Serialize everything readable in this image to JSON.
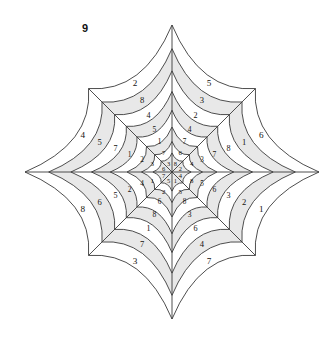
{
  "puzzle": {
    "label": "9",
    "title_visible": "9",
    "type": "spider-web-number-puzzle",
    "background_color": "#ffffff",
    "line_color": "#3a3a3a",
    "band_fill_color": "#e8e8e8",
    "band_alt_color": "#ffffff",
    "number_color": "#15130f",
    "ring_count": 8,
    "sector_count": 8,
    "center": {
      "x": 172,
      "y": 172
    },
    "outer_radius_axis": 147,
    "outer_radius_diagonal": 118
  },
  "chart_data": {
    "type": "table",
    "title": "9",
    "xlabel": "",
    "ylabel": "",
    "categories": [
      "up-left",
      "up-right",
      "right-up",
      "right-down",
      "down-right",
      "down-left",
      "left-down",
      "left-up"
    ],
    "rings": [
      1,
      2,
      3,
      4,
      5,
      6,
      7,
      8
    ],
    "series": [
      {
        "name": "up-left",
        "values": [
          8,
          6,
          7,
          4,
          2,
          3,
          5,
          0
        ]
      },
      {
        "name": "up-right",
        "values": [
          2,
          4,
          3,
          7,
          8,
          1,
          6,
          0
        ]
      },
      {
        "name": "right-up",
        "values": [
          4,
          8,
          5,
          6,
          3,
          2,
          1,
          0
        ]
      },
      {
        "name": "right-down",
        "values": [
          1,
          5,
          8,
          3,
          6,
          4,
          7,
          0
        ]
      },
      {
        "name": "down-right",
        "values": [
          5,
          2,
          6,
          8,
          1,
          7,
          3,
          0
        ]
      },
      {
        "name": "down-left",
        "values": [
          7,
          1,
          4,
          2,
          5,
          6,
          8,
          0
        ]
      },
      {
        "name": "left-down",
        "values": [
          6,
          3,
          2,
          1,
          7,
          5,
          4,
          0
        ]
      },
      {
        "name": "left-up",
        "values": [
          3,
          7,
          1,
          5,
          4,
          8,
          2,
          0
        ]
      }
    ],
    "legend_position": "none",
    "grid": true
  },
  "sectors": [
    {
      "name": "up-left",
      "label": "upper-left-of-vertical",
      "numbers_inner_to_outer": [
        "8",
        "6",
        "7",
        "4",
        "2",
        "3",
        "5"
      ]
    },
    {
      "name": "up-right",
      "label": "upper-right-of-vertical",
      "numbers_inner_to_outer": [
        "2",
        "4",
        "3",
        "7",
        "8",
        "1",
        "6"
      ]
    },
    {
      "name": "right-up",
      "label": "right-arm-upper",
      "numbers_inner_to_outer": [
        "4",
        "8",
        "5",
        "6",
        "3",
        "2",
        "1"
      ]
    },
    {
      "name": "right-down",
      "label": "right-arm-lower",
      "numbers_inner_to_outer": [
        "1",
        "5",
        "8",
        "3",
        "6",
        "4",
        "7"
      ]
    },
    {
      "name": "down-right",
      "label": "lower-right-of-vertical",
      "numbers_inner_to_outer": [
        "5",
        "2",
        "6",
        "8",
        "1",
        "7",
        "3"
      ]
    },
    {
      "name": "down-left",
      "label": "lower-left-of-vertical",
      "numbers_inner_to_outer": [
        "7",
        "1",
        "4",
        "2",
        "5",
        "6",
        "8"
      ]
    },
    {
      "name": "left-down",
      "label": "left-arm-lower",
      "numbers_inner_to_outer": [
        "6",
        "3",
        "2",
        "1",
        "7",
        "5",
        "4"
      ]
    },
    {
      "name": "left-up",
      "label": "left-arm-upper",
      "numbers_inner_to_outer": [
        "3",
        "7",
        "1",
        "5",
        "4",
        "8",
        "2"
      ]
    }
  ]
}
